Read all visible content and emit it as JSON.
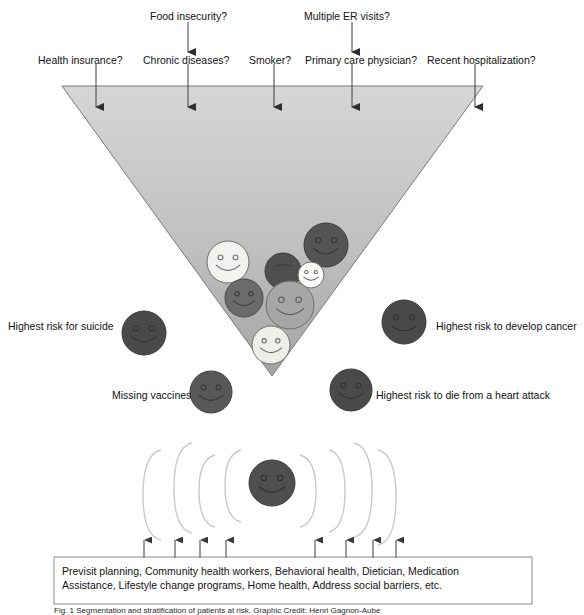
{
  "figure": {
    "caption": "Fig. 1 Segmentation and stratification of patients at risk. Graphic Credit: Henri Gagnon-Aube"
  },
  "top_questions": [
    {
      "id": "health-insurance",
      "label": "Health insurance?",
      "x": 38,
      "y": 54,
      "tick_x": 96,
      "tick_top": 64,
      "tick_bottom": 107,
      "arrow": true
    },
    {
      "id": "food-insecurity",
      "label": "Food insecurity?",
      "x": 150,
      "y": 10,
      "tick_x": 188,
      "tick_top": 22,
      "tick_bottom": 52,
      "arrow": true
    },
    {
      "id": "chronic-diseases",
      "label": "Chronic diseases?",
      "x": 143,
      "y": 54,
      "tick_x": 188,
      "tick_top": 64,
      "tick_bottom": 107,
      "arrow": true
    },
    {
      "id": "smoker",
      "label": "Smoker?",
      "x": 249,
      "y": 54,
      "tick_x": 274,
      "tick_top": 64,
      "tick_bottom": 107,
      "arrow": true
    },
    {
      "id": "multiple-er-visits",
      "label": "Multiple ER visits?",
      "x": 304,
      "y": 10,
      "tick_x": 352,
      "tick_top": 22,
      "tick_bottom": 52,
      "arrow": true
    },
    {
      "id": "primary-care-physician",
      "label": "Primary care physician?",
      "x": 305,
      "y": 54,
      "tick_x": 352,
      "tick_top": 64,
      "tick_bottom": 107,
      "arrow": true
    },
    {
      "id": "recent-hospitalization",
      "label": "Recent hospitalization?",
      "x": 427,
      "y": 54,
      "tick_x": 475,
      "tick_top": 64,
      "tick_bottom": 107,
      "arrow": true
    }
  ],
  "funnel": {
    "left_x": 62,
    "right_x": 483,
    "top_y": 86,
    "apex_x": 272,
    "apex_y": 376,
    "fill_top": "#d3d3d3",
    "fill_bottom": "#a9a9a9",
    "stroke": "#7a7a7a"
  },
  "inside_faces": [
    {
      "id": "face-light-1",
      "cx": 228,
      "cy": 262,
      "r": 21,
      "fill": "#f2f2ee",
      "stroke": "#6e6e6e",
      "smile": true
    },
    {
      "id": "face-dark-solid",
      "cx": 283,
      "cy": 271,
      "r": 18,
      "fill": "#4f4f4f",
      "stroke": "#3a3a3a",
      "smile": false
    },
    {
      "id": "face-dark-2",
      "cx": 326,
      "cy": 245,
      "r": 22,
      "fill": "#545454",
      "stroke": "#3a3a3a",
      "smile": true
    },
    {
      "id": "face-tiny-light",
      "cx": 311,
      "cy": 275,
      "r": 13,
      "fill": "#fbfbf8",
      "stroke": "#6e6e6e",
      "smile": true
    },
    {
      "id": "face-mid-dark",
      "cx": 244,
      "cy": 298,
      "r": 19,
      "fill": "#6b6b6b",
      "stroke": "#4a4a4a",
      "smile": true
    },
    {
      "id": "face-mid-gray",
      "cx": 290,
      "cy": 305,
      "r": 24,
      "fill": "#a6a6a6",
      "stroke": "#6e6e6e",
      "smile": true
    },
    {
      "id": "face-light-2",
      "cx": 271,
      "cy": 345,
      "r": 19,
      "fill": "#efefea",
      "stroke": "#6e6e6e",
      "smile": true
    }
  ],
  "outside_items": [
    {
      "id": "highest-risk-suicide",
      "label": "Highest risk for suicide",
      "label_x": 8,
      "label_y": 320,
      "label_align": "left",
      "cx": 144,
      "cy": 333,
      "r": 22,
      "fill": "#4a4a4a",
      "stroke": "#383838"
    },
    {
      "id": "highest-risk-cancer",
      "label": "Highest risk to develop cancer",
      "label_x": 436,
      "label_y": 320,
      "label_align": "left",
      "cx": 404,
      "cy": 322,
      "r": 22,
      "fill": "#4a4a4a",
      "stroke": "#383838"
    },
    {
      "id": "missing-vaccines",
      "label": "Missing vaccines",
      "label_x": 112,
      "label_y": 389,
      "label_align": "left",
      "cx": 211,
      "cy": 392,
      "r": 21,
      "fill": "#585858",
      "stroke": "#404040"
    },
    {
      "id": "highest-risk-heart-attack",
      "label": "Highest risk to die from a heart attack",
      "label_x": 376,
      "label_y": 389,
      "label_align": "left",
      "cx": 351,
      "cy": 390,
      "r": 21,
      "fill": "#4a4a4a",
      "stroke": "#383838"
    }
  ],
  "brackets": {
    "stroke": "#c9c9c9",
    "center_face": {
      "id": "center-face",
      "cx": 272,
      "cy": 483,
      "r": 23,
      "fill": "#4f4f4f",
      "stroke": "#3a3a3a"
    },
    "left_arcs": [
      {
        "x": 143,
        "top": 450,
        "bottom": 540,
        "w": 18
      },
      {
        "x": 174,
        "top": 443,
        "bottom": 533,
        "w": 18
      },
      {
        "x": 199,
        "top": 455,
        "bottom": 527,
        "w": 16
      },
      {
        "x": 225,
        "top": 450,
        "bottom": 522,
        "w": 16
      }
    ],
    "right_arcs": [
      {
        "x": 316,
        "top": 455,
        "bottom": 527,
        "w": 16
      },
      {
        "x": 345,
        "top": 450,
        "bottom": 532,
        "w": 16
      },
      {
        "x": 372,
        "top": 443,
        "bottom": 537,
        "w": 18
      },
      {
        "x": 396,
        "top": 450,
        "bottom": 545,
        "w": 18
      }
    ]
  },
  "bottom_arrows": {
    "y_tail": 558,
    "y_head": 540,
    "xs": [
      144,
      175,
      200,
      226,
      315,
      346,
      373,
      396
    ],
    "color": "#3a3a3a"
  },
  "intervention_box": {
    "x": 54,
    "y": 557,
    "width": 478,
    "height": 47,
    "stroke": "#8a8a8a",
    "line1": "Previsit planning, Community health workers, Behavioral health, Dietician, Medication",
    "line2": "Assistance, Lifestyle change programs, Home health, Address social barriers, etc."
  }
}
